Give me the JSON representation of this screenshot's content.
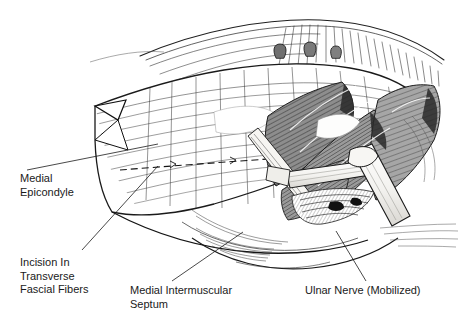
{
  "figure": {
    "kind": "surgical-illustration",
    "style": "pen-and-ink line drawing with gray hatched muscle",
    "background_color": "#ffffff",
    "ink_color": "#1a1a1a",
    "muscle_gray": "#8a8a8a",
    "nerve_pale": "#f2f1ee"
  },
  "labels": {
    "medial_epicondyle": "Medial\nEpicondyle",
    "incision": "Incision In\nTransverse\nFascial Fibers",
    "septum": "Medial Intermuscular\nSeptum",
    "ulnar_nerve": "Ulnar Nerve (Mobilized)"
  },
  "label_lines": {
    "medial_epicondyle": [
      "Medial",
      "Epicondyle"
    ],
    "incision": [
      "Incision In",
      "Transverse",
      "Fascial Fibers"
    ],
    "septum": [
      "Medial Intermuscular",
      "Septum"
    ],
    "ulnar_nerve": [
      "Ulnar Nerve (Mobilized)"
    ]
  },
  "leaders": [
    {
      "name": "leader-medial-epicondyle",
      "from": [
        27,
        170
      ],
      "to": [
        158,
        144
      ]
    },
    {
      "name": "leader-incision",
      "from": [
        82,
        250
      ],
      "to": [
        158,
        166
      ]
    },
    {
      "name": "leader-septum",
      "from": [
        172,
        281
      ],
      "to": [
        243,
        232
      ]
    },
    {
      "name": "leader-ulnar-nerve",
      "from": [
        366,
        281
      ],
      "to": [
        336,
        231
      ]
    }
  ]
}
